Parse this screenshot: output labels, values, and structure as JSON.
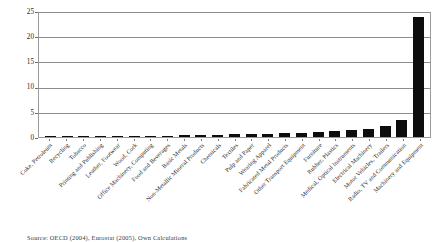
{
  "chart_data": {
    "type": "bar",
    "title": "",
    "subtitle": "",
    "xlabel": "",
    "ylabel": "",
    "ylim": [
      0,
      25
    ],
    "yticks": [
      0,
      5,
      10,
      15,
      20,
      25
    ],
    "grid": true,
    "legend": null,
    "bar_color": "#0d0d0d",
    "categories": [
      "Coke, Petroleum",
      "Recycling",
      "Tobacco",
      "Printing and Publishing",
      "Leather, Footwear",
      "Wood, Cork",
      "Office Machinery, Computing",
      "Food and Beverages",
      "Basic Metals",
      "Non-Metallic Mineral Products",
      "Chemicals",
      "Textiles",
      "Pulp and Paper",
      "Wearing Apparel",
      "Fabricated Metal Products",
      "Other Transport Equipment",
      "Furniture",
      "Rubber, Plastics",
      "Medical, Optical Instruments",
      "Electrical Machinery",
      "Motor Vehicles, Trailers",
      "Radio, TV and Communication",
      "Machinery and Equipment"
    ],
    "values": [
      0.05,
      0.07,
      0.1,
      0.12,
      0.15,
      0.18,
      0.22,
      0.3,
      0.35,
      0.4,
      0.45,
      0.5,
      0.55,
      0.6,
      0.7,
      0.8,
      0.95,
      1.1,
      1.3,
      1.5,
      2.1,
      3.3,
      23.8
    ]
  },
  "source": {
    "text": "Source: OECD (2004), Eurostat (2005), Own Calculations"
  }
}
